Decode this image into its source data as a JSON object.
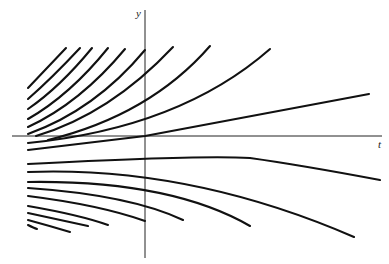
{
  "diagram": {
    "type": "solution-curves-family",
    "axes": {
      "vertical_label": "y",
      "horizontal_label": "t",
      "origin_px": [
        145,
        136
      ],
      "vertical_extent_px": [
        10,
        258
      ],
      "horizontal_extent_px": [
        12,
        382
      ]
    },
    "colors": {
      "curve": "#111111",
      "axis": "#222222",
      "background": "#ffffff"
    },
    "curves": [
      {
        "name": "upper-1",
        "d": "M28,88 Q45,70 66,48"
      },
      {
        "name": "upper-2",
        "d": "M28,99 Q52,78 80,48"
      },
      {
        "name": "upper-3",
        "d": "M28,109 Q60,87 92,48"
      },
      {
        "name": "upper-4",
        "d": "M28,119 Q70,95 108,48"
      },
      {
        "name": "upper-5",
        "d": "M28,127 Q80,103 125,49"
      },
      {
        "name": "upper-6",
        "d": "M28,134 Q95,110 145,50"
      },
      {
        "name": "upper-7",
        "d": "M36,136 Q110,114 173,47"
      },
      {
        "name": "upper-8",
        "d": "M48,140 Q150,115 210,46"
      },
      {
        "name": "upper-9",
        "d": "M28,143 Q180,128 270,49"
      },
      {
        "name": "center-line",
        "d": "M28,150 L145,136 L369,94"
      },
      {
        "name": "lower-1",
        "d": "M28,164 Q200,155 250,158 Q300,165 380,180"
      },
      {
        "name": "lower-2",
        "d": "M28,172 Q190,166 354,237"
      },
      {
        "name": "lower-3",
        "d": "M28,182 Q170,180 250,226"
      },
      {
        "name": "lower-4",
        "d": "M28,188 Q130,195 183,220"
      },
      {
        "name": "lower-5",
        "d": "M28,196 Q100,205 145,221"
      },
      {
        "name": "lower-6",
        "d": "M28,206 Q80,215 108,225"
      },
      {
        "name": "lower-7",
        "d": "M28,213 Q60,220 88,226"
      },
      {
        "name": "lower-8",
        "d": "M28,220 Q50,226 70,232"
      },
      {
        "name": "lower-9",
        "d": "M28,225 Q34,228 37,229"
      }
    ]
  }
}
